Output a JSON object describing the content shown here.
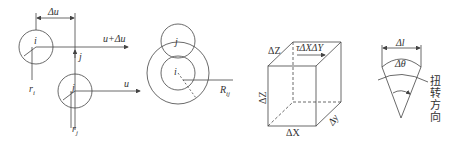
{
  "figures": [
    {
      "id": "particle-shear",
      "labels": {
        "delta_u": "Δu",
        "u_plus_delta_u": "u+Δu",
        "u": "u",
        "particle_i": "i",
        "particle_j_top": "j",
        "particle_j": "j",
        "r_i": "r",
        "r_i_sub": "i",
        "r_j": "r",
        "r_j_sub": "j"
      }
    },
    {
      "id": "particle-neighborhood",
      "labels": {
        "particle_j_upper": "j",
        "particle_i_center": "i",
        "radius": "R",
        "radius_sub": "ij"
      }
    },
    {
      "id": "shear-cube",
      "labels": {
        "top_edge": "ΔZ",
        "shear_stress": "τΔXΔY",
        "left_edge": "ΔZ",
        "bottom_edge": "ΔX",
        "depth_edge": "Δy"
      }
    },
    {
      "id": "torsion-sector",
      "labels": {
        "arc_length": "Δl",
        "angle": "Δθ",
        "direction_chars": [
          "扭",
          "转",
          "方",
          "向"
        ]
      }
    }
  ],
  "colors": {
    "stroke": "#444444",
    "text": "#333333",
    "background": "#ffffff"
  }
}
